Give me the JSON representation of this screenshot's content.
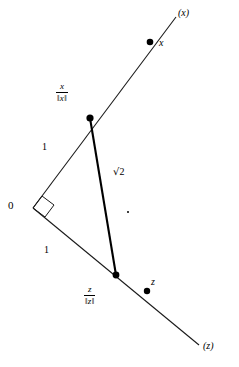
{
  "figure": {
    "background_color": "#ffffff",
    "line_color": "#1a1a1a",
    "bold_line_color": "#000000",
    "width": 239,
    "height": 367
  },
  "labels": {
    "origin": "0",
    "ray_x": "(x)",
    "ray_z": "(z)",
    "point_x": "x",
    "point_z": "z",
    "leg_upper_length": "1",
    "leg_lower_length": "1",
    "hypotenuse_length_radical": "√",
    "hypotenuse_length_value": "2",
    "unit_vector_x": {
      "numerator": "x",
      "denominator_left": "‖",
      "denominator_var": "x",
      "denominator_right": "‖"
    },
    "unit_vector_z": {
      "numerator": "z",
      "denominator_left": "‖",
      "denominator_var": "z",
      "denominator_right": "‖"
    }
  },
  "geometry": {
    "origin_point": {
      "x": 33,
      "y": 208
    },
    "ray_x_end": {
      "x": 176,
      "y": 17
    },
    "ray_z_end": {
      "x": 199,
      "y": 345
    },
    "unit_x_point": {
      "x": 90,
      "y": 118
    },
    "unit_z_point": {
      "x": 116,
      "y": 275
    },
    "point_x": {
      "x": 150,
      "y": 42
    },
    "point_z": {
      "x": 147,
      "y": 291
    },
    "right_angle_size": 13,
    "dot_radius": 3.4,
    "stray_dot": {
      "x": 128,
      "y": 212
    }
  }
}
